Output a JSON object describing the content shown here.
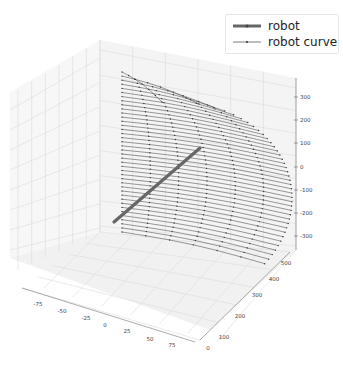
{
  "chart_data": {
    "type": "line3d",
    "title": "",
    "series": [
      {
        "name": "robot",
        "style": "thick line with markers",
        "color": "#555555",
        "points_screen_hint": "straight segment from approx (x=-60,y=0,z=-250) to (x=50,y=400,z=50)"
      },
      {
        "name": "robot curve",
        "style": "thin line with point markers",
        "color": "#444444",
        "description": "family of ~40 horizontal curves forming a quarter-cylinder surface sweeping from z=-300 to z=350"
      }
    ],
    "axes": {
      "x": {
        "label": "",
        "ticks": [
          "-75",
          "-50",
          "-25",
          "0",
          "25",
          "50",
          "75"
        ],
        "range": [
          -90,
          90
        ]
      },
      "y": {
        "label": "",
        "ticks": [
          "0",
          "100",
          "200",
          "300",
          "400",
          "500"
        ],
        "range": [
          0,
          550
        ]
      },
      "z": {
        "label": "",
        "ticks": [
          "300",
          "200",
          "100",
          "0",
          "-100",
          "-200",
          "-300"
        ],
        "range": [
          -350,
          380
        ]
      }
    },
    "grid": true,
    "legend": {
      "position": "upper right",
      "entries": [
        "robot",
        "robot curve"
      ]
    }
  },
  "legend": {
    "items": [
      {
        "label": "robot"
      },
      {
        "label": "robot curve"
      }
    ]
  },
  "axis_labels": {
    "x": [
      "-75",
      "-50",
      "-25",
      "0",
      "25",
      "50",
      "75"
    ],
    "y": [
      "0",
      "100",
      "200",
      "300",
      "400",
      "500"
    ],
    "z": [
      "300",
      "200",
      "100",
      "0",
      "-100",
      "-200",
      "-300"
    ]
  }
}
